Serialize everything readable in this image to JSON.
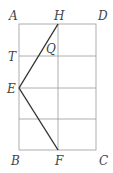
{
  "diagram": {
    "labels": {
      "A": "A",
      "H": "H",
      "D": "D",
      "T": "T",
      "Q": "Q",
      "E": "E",
      "B": "B",
      "F": "F",
      "C": "C"
    },
    "colors": {
      "grid": "#9a9a9a",
      "lines": "#333333",
      "text": "#444444"
    },
    "points": {
      "A": [
        19,
        24
      ],
      "H": [
        58,
        24
      ],
      "D": [
        96,
        24
      ],
      "T": [
        19,
        56
      ],
      "E": [
        19,
        88
      ],
      "B": [
        19,
        150
      ],
      "F": [
        58,
        150
      ],
      "C": [
        96,
        150
      ]
    },
    "segments": [
      "HE",
      "EF"
    ]
  }
}
